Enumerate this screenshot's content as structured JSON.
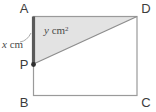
{
  "figure": {
    "type": "geometry-diagram",
    "shape": "rectangle-with-inscribed-triangle",
    "vertices": {
      "a": "A",
      "b": "B",
      "c": "C",
      "d": "D",
      "p": "P"
    },
    "labels": {
      "side_length": "x cm",
      "side_length_symbol": "x",
      "side_length_unit": "cm",
      "area": "y cm²",
      "area_symbol": "y",
      "area_unit": "cm",
      "area_unit_exponent": "2"
    },
    "colors": {
      "shaded_region": "#e3e3e3",
      "outline": "#9a9a9a",
      "thick_segment": "#5a5a5a",
      "label_text": "#3c3c3c",
      "measure_text": "#4a4a4a",
      "background": "#ffffff"
    }
  }
}
